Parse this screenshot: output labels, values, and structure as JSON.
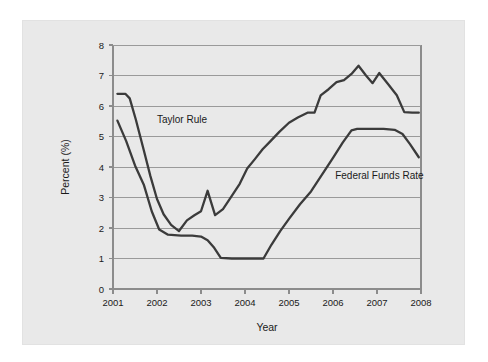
{
  "chart_data": {
    "type": "line",
    "title": "",
    "xlabel": "Year",
    "ylabel": "Percent (%)",
    "xlim": [
      2001.0,
      2008.0
    ],
    "ylim": [
      0,
      8
    ],
    "xticks": [
      "2001",
      "2002",
      "2003",
      "2004",
      "2005",
      "2006",
      "2007",
      "2008"
    ],
    "xtick_values": [
      2001,
      2002,
      2003,
      2004,
      2005,
      2006,
      2007,
      2008
    ],
    "yticks": [
      "0",
      "1",
      "2",
      "3",
      "4",
      "5",
      "6",
      "7",
      "8"
    ],
    "ytick_values": [
      0,
      1,
      2,
      3,
      4,
      5,
      6,
      7,
      8
    ],
    "grid": "horizontal",
    "legend_position": "inline-annotations",
    "series": [
      {
        "name": "Taylor Rule",
        "label_x": 2002.0,
        "label_y": 5.45,
        "points": [
          [
            2001.1,
            6.4
          ],
          [
            2001.28,
            6.4
          ],
          [
            2001.38,
            6.25
          ],
          [
            2001.52,
            5.55
          ],
          [
            2001.7,
            4.55
          ],
          [
            2001.85,
            3.7
          ],
          [
            2002.0,
            2.95
          ],
          [
            2002.15,
            2.45
          ],
          [
            2002.32,
            2.1
          ],
          [
            2002.5,
            1.9
          ],
          [
            2002.68,
            2.25
          ],
          [
            2002.85,
            2.42
          ],
          [
            2003.0,
            2.55
          ],
          [
            2003.15,
            3.22
          ],
          [
            2003.32,
            2.42
          ],
          [
            2003.5,
            2.62
          ],
          [
            2003.7,
            3.05
          ],
          [
            2003.88,
            3.45
          ],
          [
            2004.05,
            3.95
          ],
          [
            2004.22,
            4.25
          ],
          [
            2004.4,
            4.58
          ],
          [
            2004.58,
            4.85
          ],
          [
            2004.78,
            5.15
          ],
          [
            2005.0,
            5.45
          ],
          [
            2005.2,
            5.62
          ],
          [
            2005.42,
            5.78
          ],
          [
            2005.58,
            5.78
          ],
          [
            2005.72,
            6.35
          ],
          [
            2005.9,
            6.55
          ],
          [
            2006.08,
            6.78
          ],
          [
            2006.25,
            6.85
          ],
          [
            2006.42,
            7.05
          ],
          [
            2006.58,
            7.32
          ],
          [
            2006.75,
            7.0
          ],
          [
            2006.9,
            6.75
          ],
          [
            2007.05,
            7.08
          ],
          [
            2007.25,
            6.72
          ],
          [
            2007.45,
            6.35
          ],
          [
            2007.62,
            5.8
          ],
          [
            2007.8,
            5.78
          ],
          [
            2007.95,
            5.78
          ]
        ]
      },
      {
        "name": "Federal Funds Rate",
        "label_x": 2006.05,
        "label_y": 3.62,
        "points": [
          [
            2001.1,
            5.52
          ],
          [
            2001.3,
            4.85
          ],
          [
            2001.5,
            4.05
          ],
          [
            2001.7,
            3.42
          ],
          [
            2001.88,
            2.55
          ],
          [
            2002.05,
            1.95
          ],
          [
            2002.25,
            1.78
          ],
          [
            2002.55,
            1.75
          ],
          [
            2002.8,
            1.75
          ],
          [
            2003.0,
            1.72
          ],
          [
            2003.15,
            1.6
          ],
          [
            2003.3,
            1.35
          ],
          [
            2003.45,
            1.02
          ],
          [
            2003.7,
            1.0
          ],
          [
            2004.0,
            1.0
          ],
          [
            2004.25,
            1.0
          ],
          [
            2004.42,
            1.0
          ],
          [
            2004.6,
            1.45
          ],
          [
            2004.8,
            1.9
          ],
          [
            2005.0,
            2.3
          ],
          [
            2005.25,
            2.78
          ],
          [
            2005.5,
            3.2
          ],
          [
            2005.75,
            3.75
          ],
          [
            2006.0,
            4.3
          ],
          [
            2006.22,
            4.8
          ],
          [
            2006.42,
            5.2
          ],
          [
            2006.55,
            5.25
          ],
          [
            2006.85,
            5.25
          ],
          [
            2007.15,
            5.25
          ],
          [
            2007.4,
            5.22
          ],
          [
            2007.58,
            5.08
          ],
          [
            2007.75,
            4.75
          ],
          [
            2007.95,
            4.32
          ]
        ]
      }
    ]
  }
}
